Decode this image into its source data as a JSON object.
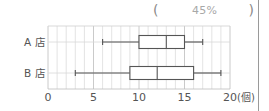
{
  "answer_box": {
    "left_paren": "(",
    "value": "45%",
    "right_paren": ")"
  },
  "chart_data": {
    "type": "boxplot",
    "orientation": "horizontal",
    "title": "",
    "xlabel": "(個)",
    "ylabel": "",
    "xlim": [
      0,
      20
    ],
    "x_ticks": [
      0,
      5,
      10,
      15,
      20
    ],
    "x_tick_labels": [
      "0",
      "5",
      "10",
      "15",
      "20"
    ],
    "x_unit": "(個)",
    "grid": {
      "vertical_every": 1,
      "on": true
    },
    "categories": [
      "A店",
      "B店"
    ],
    "series": [
      {
        "name": "A店",
        "min": 6,
        "q1": 10,
        "median": 13,
        "q3": 15,
        "max": 17
      },
      {
        "name": "B店",
        "min": 3,
        "q1": 9,
        "median": 12,
        "q3": 16,
        "max": 19
      }
    ]
  },
  "labels": {
    "a_store": "A 店",
    "b_store": "B 店"
  },
  "colors": {
    "grid": "#d4d4d4",
    "box": "#555555",
    "text": "#555555"
  }
}
